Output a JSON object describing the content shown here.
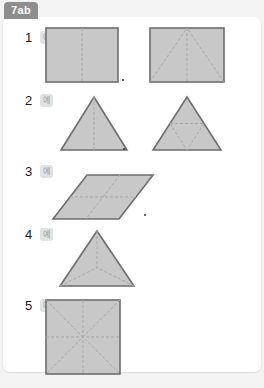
{
  "page": {
    "tab_label": "7ab",
    "background_color": "#f4f4f4",
    "sheet_color": "#ffffff",
    "tab_color": "#8e8e8e"
  },
  "shape_style": {
    "fill": "#c8c8c8",
    "stroke": "#6e6e6e",
    "dash_color": "#a9a9a9"
  },
  "rows": [
    {
      "number": "1",
      "badge": "예",
      "figures": [
        {
          "name": "rectangle-with-vertical-midline",
          "type": "rectangle",
          "parts": 2,
          "interior_lines": [
            "vertical-midline"
          ]
        },
        {
          "name": "rectangle-with-inscribed-triangle",
          "type": "rectangle",
          "parts": 4,
          "interior_lines": [
            "diagonal-left-to-apex",
            "diagonal-right-to-apex",
            "vertical-midline"
          ]
        }
      ],
      "marker_dot": true
    },
    {
      "number": "2",
      "badge": "예",
      "figures": [
        {
          "name": "triangle-with-vertical-midline",
          "type": "triangle",
          "parts": 2,
          "interior_lines": [
            "vertical-midline"
          ]
        },
        {
          "name": "triangle-with-midsegments",
          "type": "triangle",
          "parts": 4,
          "interior_lines": [
            "midsegment-bottom",
            "midsegment-left",
            "midsegment-right"
          ]
        }
      ],
      "marker_dot": true
    },
    {
      "number": "3",
      "badge": "예",
      "figures": [
        {
          "name": "rhombus-with-diagonals",
          "type": "rhombus",
          "parts": 4,
          "interior_lines": [
            "diagonal-horizontal",
            "diagonal-vertical"
          ]
        }
      ],
      "marker_dot": true
    },
    {
      "number": "4",
      "badge": "예",
      "figures": [
        {
          "name": "triangle-with-medians",
          "type": "triangle",
          "parts": 3,
          "interior_lines": [
            "median-from-apex",
            "median-from-left",
            "median-from-right"
          ]
        }
      ],
      "marker_dot": false
    },
    {
      "number": "5",
      "badge": "예",
      "figures": [
        {
          "name": "square-with-diagonals-and-midlines",
          "type": "square",
          "parts": 8,
          "interior_lines": [
            "diagonal-tl-br",
            "diagonal-tr-bl",
            "vertical-midline",
            "horizontal-midline"
          ]
        }
      ],
      "marker_dot": false
    }
  ]
}
